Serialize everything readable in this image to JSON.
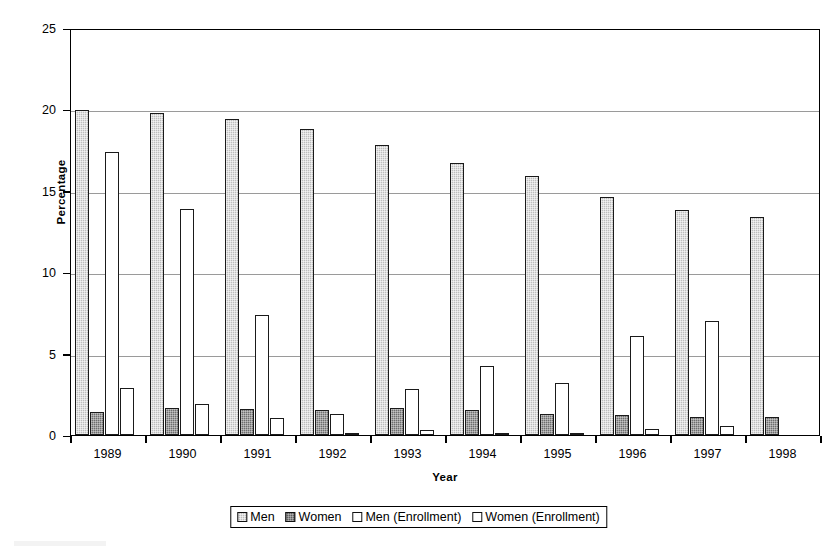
{
  "chart_data": {
    "type": "bar",
    "title": "",
    "xlabel": "Year",
    "ylabel": "Percentage",
    "ylim": [
      0,
      25
    ],
    "yticks": [
      0,
      5,
      10,
      15,
      20,
      25
    ],
    "ytick_labels": [
      "0",
      "5",
      "10",
      "15",
      "20",
      "25"
    ],
    "grid": true,
    "grid_axis": "y",
    "legend_position": "bottom-center",
    "categories": [
      "1989",
      "1990",
      "1991",
      "1992",
      "1993",
      "1994",
      "1995",
      "1996",
      "1997",
      "1998"
    ],
    "series": [
      {
        "name": "Men",
        "color": "#bdbdbd",
        "pattern": "light-gray-hatch",
        "values": [
          19.95,
          19.8,
          19.4,
          18.8,
          17.8,
          16.7,
          15.9,
          14.65,
          13.85,
          13.4
        ]
      },
      {
        "name": "Women",
        "color": "#6e6e6e",
        "pattern": "dark-gray-hatch",
        "values": [
          1.4,
          1.65,
          1.6,
          1.55,
          1.65,
          1.55,
          1.3,
          1.2,
          1.1,
          1.1
        ]
      },
      {
        "name": "Men (Enrollment)",
        "color": "#ffffff",
        "pattern": "white-outline",
        "values": [
          17.4,
          13.9,
          7.35,
          1.3,
          2.8,
          4.25,
          3.2,
          6.1,
          7.0,
          null
        ]
      },
      {
        "name": "Women (Enrollment)",
        "color": "#ffffff",
        "pattern": "white-outline",
        "values": [
          2.9,
          1.9,
          1.05,
          0.15,
          0.3,
          0.15,
          0.15,
          0.35,
          0.55,
          null
        ]
      }
    ]
  },
  "axes": {
    "y_title": "Percentage",
    "x_title": "Year"
  },
  "legend": {
    "items": [
      {
        "label": "Men",
        "swatch": "men"
      },
      {
        "label": "Women",
        "swatch": "women"
      },
      {
        "label": "Men (Enrollment)",
        "swatch": "men-enroll"
      },
      {
        "label": "Women (Enrollment)",
        "swatch": "women-enroll"
      }
    ]
  }
}
